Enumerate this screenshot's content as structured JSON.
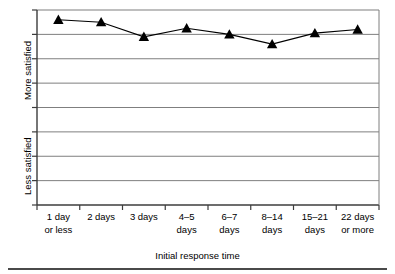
{
  "chart_data": {
    "type": "line",
    "title": "",
    "subtitle": "",
    "xlabel": "Initial response time",
    "ylabel": "",
    "categories": [
      "1 day or less",
      "2 days",
      "3 days",
      "4–5 days",
      "6–7 days",
      "8–14 days",
      "15–21 days",
      "22 days or more"
    ],
    "series": [
      {
        "name": "Satisfaction",
        "marker": "triangle",
        "color": "#000000",
        "values": [
          7.6,
          7.5,
          6.9,
          7.25,
          7.0,
          6.6,
          7.05,
          7.2
        ]
      }
    ],
    "ylim": [
      0,
      8
    ],
    "yaxis_low_label": "Less satisfied",
    "yaxis_high_label": "More satisfied",
    "ytick_count": 8,
    "grid": true,
    "grid_orientation": "horizontal",
    "legend": "none",
    "annotations": []
  },
  "axes": {
    "y": {
      "low_label": "Less satisfied",
      "high_label": "More satisfied"
    },
    "x": {
      "title": "Initial response time",
      "ticks": [
        {
          "line1": "1 day",
          "line2": "or less"
        },
        {
          "line1": "2 days",
          "line2": ""
        },
        {
          "line1": "3 days",
          "line2": ""
        },
        {
          "line1": "4–5",
          "line2": "days"
        },
        {
          "line1": "6–7",
          "line2": "days"
        },
        {
          "line1": "8–14",
          "line2": "days"
        },
        {
          "line1": "15–21",
          "line2": "days"
        },
        {
          "line1": "22 days",
          "line2": "or more"
        }
      ]
    }
  },
  "style": {
    "grid_color": "#7f7f7f",
    "axis_color": "#3c3c3c",
    "series_color": "#000000",
    "background": "#ffffff",
    "rule_color": "#4a4a4a"
  }
}
